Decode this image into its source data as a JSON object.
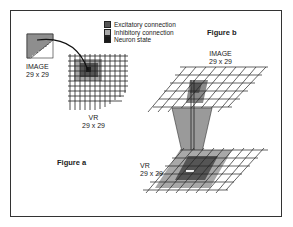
{
  "legend": {
    "items": [
      {
        "label": "Excitatory connection",
        "color": "#555555"
      },
      {
        "label": "Inhibitory connection",
        "color": "#a8a8a8"
      },
      {
        "label": "Neuron state",
        "color": "#1a1a1a"
      }
    ]
  },
  "figure_a": {
    "caption": "Figure a",
    "image_label": "IMAGE",
    "image_size": "29 x 29",
    "vr_label": "VR",
    "vr_size": "29 x 29"
  },
  "figure_b": {
    "caption": "Figure b",
    "image_label": "IMAGE",
    "image_size": "29 x 29",
    "vr_label": "VR",
    "vr_size": "29 x 29"
  },
  "colors": {
    "excitatory": "#555555",
    "inhibitory": "#a8a8a8",
    "neuron": "#1a1a1a",
    "funnel": "#9a9a9a"
  }
}
